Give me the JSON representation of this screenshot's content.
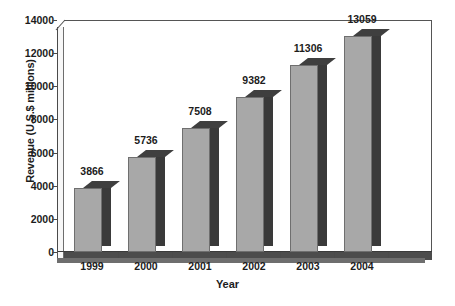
{
  "chart_data": {
    "type": "bar",
    "title": "",
    "subtitle": "",
    "xlabel": "Year",
    "ylabel": "Revenue (U.S.$ millions)",
    "categories": [
      "1999",
      "2000",
      "2001",
      "2002",
      "2003",
      "2004"
    ],
    "values": [
      3866,
      5736,
      7508,
      9382,
      11306,
      13059
    ],
    "series": [
      {
        "name": "Revenue",
        "values": [
          3866,
          5736,
          7508,
          9382,
          11306,
          13059
        ]
      }
    ],
    "data_labels": [
      "3866",
      "5736",
      "7508",
      "9382",
      "11306",
      "13059"
    ],
    "ylim": [
      0,
      14000
    ],
    "ytick_values": [
      0,
      2000,
      4000,
      6000,
      8000,
      10000,
      12000,
      14000
    ],
    "ytick_labels": [
      "0",
      "2000",
      "4000",
      "6000",
      "8000",
      "10000",
      "12000",
      "14000"
    ],
    "grid": false,
    "legend": false,
    "legend_position": "none",
    "style": "3d-bar",
    "colors": {
      "bar_face": "#a8a8a8",
      "bar_side": "#3a3a3a",
      "bar_top": "#3f3f3f",
      "bar_outline": "#6f6f6f",
      "axis": "#4a4a4a",
      "floor": "#4c4c4c",
      "text": "#1c1c1c",
      "background": "#ffffff"
    }
  }
}
